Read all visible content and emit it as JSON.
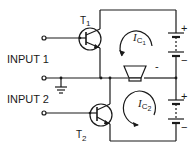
{
  "diagram": {
    "type": "circuit-schematic",
    "labels": {
      "input1": "INPUT 1",
      "input2": "INPUT 2",
      "t1": "T",
      "t1_sub": "1",
      "t2": "T",
      "t2_sub": "2",
      "ic1": "I",
      "ic1_sub": "C",
      "ic1_subsub": "1",
      "ic2": "I",
      "ic2_sub": "C",
      "ic2_subsub": "2",
      "batt1_plus": "+",
      "batt1_minus": "−",
      "batt2_plus": "+",
      "batt2_minus": "−",
      "mid_minus": "-"
    },
    "components": [
      {
        "id": "T1",
        "kind": "npn-transistor"
      },
      {
        "id": "T2",
        "kind": "npn-transistor"
      },
      {
        "id": "SPK",
        "kind": "speaker"
      },
      {
        "id": "B1",
        "kind": "battery"
      },
      {
        "id": "B2",
        "kind": "battery"
      },
      {
        "id": "GND",
        "kind": "ground"
      }
    ],
    "colors": {
      "line": "#1a1a1a",
      "background": "#ffffff"
    }
  }
}
